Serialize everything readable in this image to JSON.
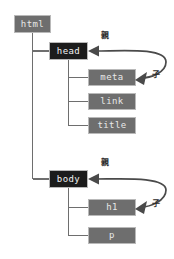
{
  "diagram": {
    "type": "dom-tree",
    "colors": {
      "background": "#ffffff",
      "node_gray_fill": "#6e6e6e",
      "node_dark_fill": "#1c1c1c",
      "node_border": "#b9b9b9",
      "node_text": "#e8e8e8",
      "connector": "#6e6e6e",
      "arrow": "#4a4a4a",
      "label_text": "#2b2b2b"
    },
    "nodes": [
      {
        "id": "html",
        "label": "html",
        "style": "gray",
        "x": 14,
        "y": 15,
        "w": 37,
        "h": 18
      },
      {
        "id": "head",
        "label": "head",
        "style": "dark",
        "x": 49,
        "y": 42,
        "w": 39,
        "h": 18
      },
      {
        "id": "meta",
        "label": "meta",
        "style": "gray",
        "x": 88,
        "y": 69,
        "w": 48,
        "h": 17
      },
      {
        "id": "link",
        "label": "link",
        "style": "gray",
        "x": 88,
        "y": 93,
        "w": 48,
        "h": 17
      },
      {
        "id": "title",
        "label": "title",
        "style": "gray",
        "x": 88,
        "y": 117,
        "w": 48,
        "h": 17
      },
      {
        "id": "body",
        "label": "body",
        "style": "dark",
        "x": 49,
        "y": 170,
        "w": 39,
        "h": 18
      },
      {
        "id": "h1",
        "label": "h1",
        "style": "gray",
        "x": 88,
        "y": 199,
        "w": 48,
        "h": 17
      },
      {
        "id": "p",
        "label": "p",
        "style": "gray",
        "x": 88,
        "y": 227,
        "w": 48,
        "h": 17
      }
    ],
    "edges": [
      {
        "from": "html",
        "to": "head",
        "kind": "tree"
      },
      {
        "from": "html",
        "to": "body",
        "kind": "tree"
      },
      {
        "from": "head",
        "to": "meta",
        "kind": "tree"
      },
      {
        "from": "head",
        "to": "link",
        "kind": "tree"
      },
      {
        "from": "head",
        "to": "title",
        "kind": "tree"
      },
      {
        "from": "body",
        "to": "h1",
        "kind": "tree"
      },
      {
        "from": "body",
        "to": "p",
        "kind": "tree"
      }
    ],
    "annotations": [
      {
        "id": "parent-head",
        "text": "親",
        "x": 101,
        "y": 34,
        "relates_to": "head",
        "meaning": "parent"
      },
      {
        "id": "child-meta",
        "text": "子",
        "x": 152,
        "y": 72,
        "relates_to": "meta",
        "meaning": "child"
      },
      {
        "id": "parent-body",
        "text": "親",
        "x": 101,
        "y": 161,
        "relates_to": "body",
        "meaning": "parent"
      },
      {
        "id": "child-h1",
        "text": "子",
        "x": 152,
        "y": 201,
        "relates_to": "h1",
        "meaning": "child"
      }
    ],
    "relation_arcs": [
      {
        "id": "head-meta-arc",
        "from_arrowhead_at": "head-right",
        "to_arrowhead_at": "meta-right"
      },
      {
        "id": "body-h1-arc",
        "from_arrowhead_at": "body-right",
        "to_arrowhead_at": "h1-right"
      }
    ]
  }
}
